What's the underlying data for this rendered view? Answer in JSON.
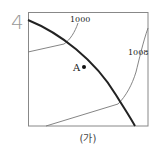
{
  "question_number": "4",
  "figure": {
    "caption": "(가)",
    "point": {
      "label": "A",
      "x": 84,
      "y": 67
    },
    "isobars": [
      {
        "label": "1000",
        "label_x": 70,
        "label_y": 21
      },
      {
        "label": "1008",
        "label_x": 128,
        "label_y": 55
      }
    ],
    "front": {
      "description": "thick curved line from top-left to bottom-right"
    }
  },
  "colors": {
    "frame": "#888888",
    "isobar": "#777777",
    "front": "#222222",
    "number": "#999999",
    "text": "#222222"
  }
}
